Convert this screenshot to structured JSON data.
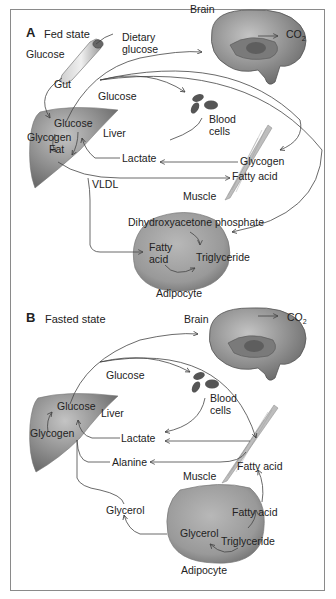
{
  "figure": {
    "panels": [
      {
        "letter": "A",
        "title": "Fed state",
        "organs": {
          "gut": "Gut",
          "liver": "Liver",
          "brain": "Brain",
          "blood_cells_1": "Blood",
          "blood_cells_2": "cells",
          "muscle": "Muscle",
          "adipocyte": "Adipocyte"
        },
        "metabolites": {
          "glucose_left": "Glucose",
          "dietary_1": "Dietary",
          "dietary_2": "glucose",
          "glucose_flow": "Glucose",
          "liver_glucose": "Glucose",
          "liver_glycogen": "Glycogen",
          "liver_fat": "Fat",
          "lactate": "Lactate",
          "muscle_glycogen": "Glycogen",
          "muscle_fatty_acid": "Fatty acid",
          "vldl": "VLDL",
          "dhap": "Dihydroxyacetone phosphate",
          "adipo_fatty_1": "Fatty",
          "adipo_fatty_2": "acid",
          "triglyceride": "Triglyceride",
          "co2": "CO",
          "co2_sub": "2"
        }
      },
      {
        "letter": "B",
        "title": "Fasted state",
        "organs": {
          "brain": "Brain",
          "liver": "Liver",
          "blood_cells_1": "Blood",
          "blood_cells_2": "cells",
          "muscle": "Muscle",
          "adipocyte": "Adipocyte"
        },
        "metabolites": {
          "glucose_flow": "Glucose",
          "liver_glucose": "Glucose",
          "liver_glycogen": "Glycogen",
          "lactate": "Lactate",
          "alanine": "Alanine",
          "muscle_fatty_acid": "Fatty acid",
          "glycerol_out": "Glycerol",
          "adipo_glycerol": "Glycerol",
          "adipo_fatty_acid": "Fatty acid",
          "triglyceride": "Triglyceride",
          "co2": "CO",
          "co2_sub": "2"
        }
      }
    ],
    "colors": {
      "organ_fill": "#8f8f8f",
      "organ_dark": "#6e6e6e",
      "line": "#444444",
      "frame": "#8a8a8a"
    }
  }
}
